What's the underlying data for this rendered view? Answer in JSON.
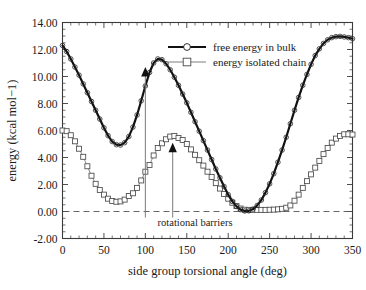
{
  "chart_data": {
    "type": "line",
    "title": "",
    "xlabel": "side group torsional angle (deg)",
    "ylabel": "energy (kcal mol−1)",
    "xlim": [
      0,
      350
    ],
    "ylim": [
      -2.0,
      14.0
    ],
    "xticks": [
      0,
      50,
      100,
      150,
      200,
      250,
      300,
      350
    ],
    "xticklabels": [
      "0",
      "50",
      "100",
      "150",
      "200",
      "250",
      "300",
      "350"
    ],
    "yticks": [
      -2.0,
      0.0,
      2.0,
      4.0,
      6.0,
      8.0,
      10.0,
      12.0,
      14.0
    ],
    "yticklabels": [
      "-2.00",
      "0.00",
      "2.00",
      "4.00",
      "6.00",
      "8.00",
      "10.00",
      "12.00",
      "14.00"
    ],
    "grid": false,
    "legend_position": "top-right",
    "series": [
      {
        "name": "free energy in bulk",
        "marker": "circle",
        "color": "#111111",
        "x": [
          0,
          5,
          10,
          15,
          20,
          25,
          30,
          35,
          40,
          45,
          50,
          55,
          60,
          65,
          70,
          75,
          80,
          85,
          90,
          95,
          100,
          105,
          110,
          115,
          120,
          125,
          130,
          135,
          140,
          145,
          150,
          155,
          160,
          165,
          170,
          175,
          180,
          185,
          190,
          195,
          200,
          205,
          210,
          215,
          220,
          225,
          230,
          235,
          240,
          245,
          250,
          255,
          260,
          265,
          270,
          275,
          280,
          285,
          290,
          295,
          300,
          305,
          310,
          315,
          320,
          325,
          330,
          335,
          340,
          345,
          350
        ],
        "y": [
          12.3,
          11.85,
          11.3,
          10.7,
          10.1,
          9.45,
          8.8,
          8.15,
          7.5,
          6.85,
          6.2,
          5.62,
          5.18,
          4.95,
          4.92,
          5.1,
          5.55,
          6.25,
          7.15,
          8.2,
          9.3,
          10.3,
          11.0,
          11.3,
          11.25,
          10.95,
          10.5,
          9.95,
          9.35,
          8.7,
          8.05,
          7.35,
          6.65,
          5.95,
          5.25,
          4.55,
          3.85,
          3.15,
          2.5,
          1.85,
          1.25,
          0.75,
          0.38,
          0.14,
          0.04,
          0.05,
          0.18,
          0.45,
          0.85,
          1.4,
          2.05,
          2.8,
          3.65,
          4.55,
          5.5,
          6.5,
          7.5,
          8.45,
          9.35,
          10.15,
          10.9,
          11.55,
          12.05,
          12.45,
          12.72,
          12.88,
          12.95,
          12.97,
          12.93,
          12.88,
          12.8
        ]
      },
      {
        "name": "energy isolated chain",
        "marker": "square",
        "color": "#6e6e6e",
        "x": [
          0,
          5,
          10,
          15,
          20,
          25,
          30,
          35,
          40,
          45,
          50,
          55,
          60,
          65,
          70,
          75,
          80,
          85,
          90,
          95,
          100,
          105,
          110,
          115,
          120,
          125,
          130,
          135,
          140,
          145,
          150,
          155,
          160,
          165,
          170,
          175,
          180,
          185,
          190,
          195,
          200,
          205,
          210,
          215,
          220,
          225,
          230,
          235,
          240,
          245,
          250,
          255,
          260,
          265,
          270,
          275,
          280,
          285,
          290,
          295,
          300,
          305,
          310,
          315,
          320,
          325,
          330,
          335,
          340,
          345,
          350
        ],
        "y": [
          6.0,
          5.95,
          5.65,
          5.2,
          4.65,
          4.05,
          3.35,
          2.65,
          2.05,
          1.6,
          1.25,
          0.95,
          0.78,
          0.72,
          0.75,
          0.88,
          1.15,
          1.35,
          1.75,
          2.3,
          2.95,
          3.45,
          4.15,
          4.7,
          5.05,
          5.35,
          5.55,
          5.6,
          5.45,
          5.3,
          5.0,
          4.6,
          4.2,
          3.8,
          3.4,
          2.95,
          2.55,
          2.1,
          1.7,
          1.3,
          0.95,
          0.65,
          0.4,
          0.22,
          0.13,
          0.12,
          0.12,
          0.12,
          0.12,
          0.12,
          0.13,
          0.14,
          0.16,
          0.2,
          0.28,
          0.45,
          0.8,
          1.25,
          1.75,
          2.25,
          2.75,
          3.25,
          3.75,
          4.25,
          4.7,
          5.1,
          5.4,
          5.6,
          5.72,
          5.72,
          5.7
        ]
      }
    ],
    "annotations": [
      {
        "text": "rotational barriers",
        "x": 160,
        "y": -1.1
      },
      {
        "text": "",
        "type": "arrow",
        "x": 100,
        "y_from": -0.45,
        "y_to": 10.7
      },
      {
        "text": "",
        "type": "arrow",
        "x": 133,
        "y_from": -0.45,
        "y_to": 5.1
      }
    ],
    "reference_lines": [
      {
        "orientation": "horizontal",
        "value": 0.0,
        "style": "dashed"
      }
    ]
  },
  "legend": {
    "entries": [
      {
        "label": "free energy in bulk",
        "marker": "circle"
      },
      {
        "label": "energy isolated chain",
        "marker": "square"
      }
    ]
  },
  "annotation_text": {
    "rotational_barriers": "rotational barriers"
  }
}
